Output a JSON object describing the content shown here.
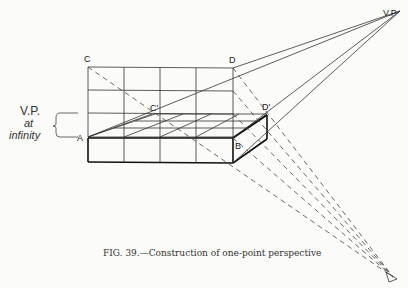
{
  "figure": {
    "caption": "FIG. 39.—Construction of one-point perspective",
    "labels": {
      "C": "C",
      "D": "D",
      "C_prime": "C'",
      "D_prime": "D'",
      "A": "A",
      "B": "B",
      "VP": "V.P",
      "vp_infinity_line1": "V.P.",
      "vp_infinity_line2": "at",
      "vp_infinity_line3": "infinity"
    },
    "colors": {
      "ink": "#222222",
      "paper": "#fbfbf9"
    }
  }
}
